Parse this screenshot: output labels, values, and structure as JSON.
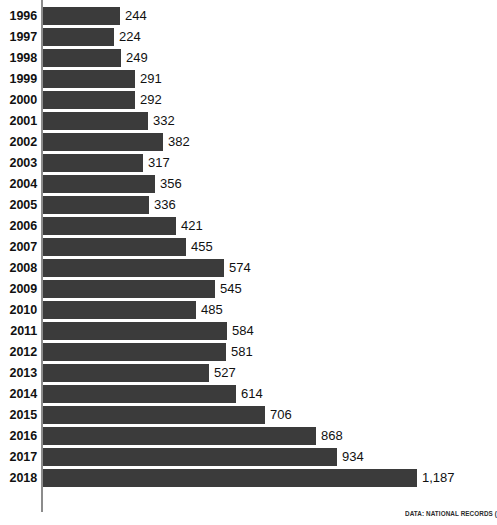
{
  "chart_data": {
    "type": "bar",
    "orientation": "horizontal",
    "title": "",
    "subtitle": "",
    "xlabel": "",
    "ylabel": "",
    "grid": false,
    "legend": null,
    "axis_line": true,
    "xlim": [
      0,
      1187
    ],
    "categories": [
      "1996",
      "1997",
      "1998",
      "1999",
      "2000",
      "2001",
      "2002",
      "2003",
      "2004",
      "2005",
      "2006",
      "2007",
      "2008",
      "2009",
      "2010",
      "2011",
      "2012",
      "2013",
      "2014",
      "2015",
      "2016",
      "2017",
      "2018"
    ],
    "values": [
      244,
      224,
      249,
      291,
      292,
      332,
      382,
      317,
      356,
      336,
      421,
      455,
      574,
      545,
      485,
      584,
      581,
      527,
      614,
      706,
      868,
      934,
      1187
    ],
    "value_labels": [
      "244",
      "224",
      "249",
      "291",
      "292",
      "332",
      "382",
      "317",
      "356",
      "336",
      "421",
      "455",
      "574",
      "545",
      "485",
      "584",
      "581",
      "527",
      "614",
      "706",
      "868",
      "934",
      "1,187"
    ],
    "bar_color": "#3b3b3b",
    "axis_color": "#8c8c8c",
    "background": "#ffffff",
    "text_color": "#111111"
  },
  "source": {
    "note": "DATA: NATIONAL RECORDS ("
  }
}
